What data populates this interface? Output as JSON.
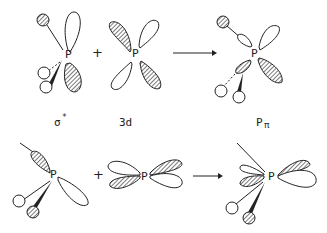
{
  "diagram": {
    "type": "orbital-interaction-scheme",
    "rows": [
      {
        "reactant_1": {
          "center": "P",
          "label": "σ*"
        },
        "operator": "+",
        "reactant_2": {
          "center": "P",
          "label": "3d"
        },
        "arrow": "→",
        "product": {
          "center": "P",
          "label": "Pπ"
        }
      },
      {
        "reactant_1": {
          "center": "P",
          "label": ""
        },
        "operator": "+",
        "reactant_2": {
          "center": "P",
          "label": ""
        },
        "arrow": "→",
        "product": {
          "center": "P",
          "label": ""
        }
      }
    ],
    "labels": {
      "sigma_star": "σ",
      "sigma_star_sup": "*",
      "three_d": "3d",
      "p_pi_main": "P",
      "p_pi_sub": "π"
    },
    "atom": "P",
    "plus": "+",
    "colors": {
      "line": "#222222",
      "background": "#ffffff"
    }
  }
}
